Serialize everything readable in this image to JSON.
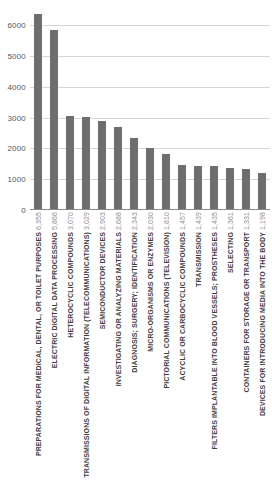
{
  "chart_data": {
    "type": "bar",
    "title": "",
    "subtitle": "",
    "xlabel": "",
    "ylabel": "",
    "ylim": [
      0,
      6500
    ],
    "grid": true,
    "legend": "none",
    "orientation": "vertical",
    "bar_color": "#6e6e6e",
    "gridline_color": "#d6d6d6",
    "axis_color": "#8a8a8a",
    "y_ticks": [
      0,
      1000,
      2000,
      3000,
      4000,
      5000,
      6000
    ],
    "y_tick_labels": [
      "0",
      "1000",
      "2000",
      "3000",
      "4000",
      "5000",
      "6000"
    ],
    "categories": [
      "PREPARATIONS FOR MEDICAL, DENTAL, OR TOILET PURPOSES",
      "ELECTRIC DIGITAL DATA PROCESSING",
      "HETEROCYCLIC COMPOUNDS",
      "TRANSMISSIONS OF DIGITAL INFORMATION (TELECOMMUNICATIONS)",
      "SEMICONDUCTOR DEVICES",
      "INVESTIGATING OR ANALYZING MATERIALS",
      "DIAGNOSIS; SURGERY; IDENTIFICATION",
      "MICRO-ORGANISMS OR ENZYMES",
      "PICTORIAL COMMUNICATIONS (TELEVISION)",
      "ACYCLIC OR CARBOCYCLIC COMPOUNDS",
      "TRANSMISSION",
      "FILTERS IMPLANTABLE INTO BLOOD VESSELS; PROSTHESES",
      "SELECTING",
      "CONTAINERS FOR STORAGE OR TRANSPORT",
      "DEVICES FOR INTRODUCING MEDIA INTO THE BODY"
    ],
    "values": [
      6355,
      5866,
      3070,
      3029,
      2903,
      2688,
      2343,
      2030,
      1810,
      1457,
      1439,
      1435,
      1361,
      1331,
      1198
    ],
    "value_labels": [
      "6,355",
      "5,866",
      "3,070",
      "3,029",
      "2,903",
      "2,688",
      "2,343",
      "2,030",
      "1,810",
      "1,457",
      "1,439",
      "1,435",
      "1,361",
      "1,331",
      "1,198"
    ]
  }
}
